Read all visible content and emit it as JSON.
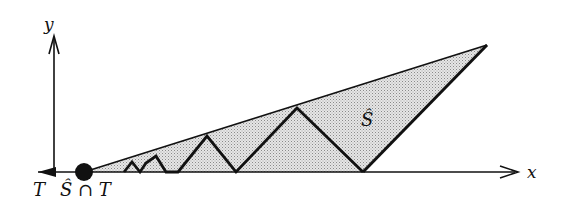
{
  "diagram": {
    "axes": {
      "x_label": "x",
      "y_label": "y"
    },
    "region_label": "Ŝ",
    "bottom_left_label_T": "T",
    "bottom_center_label": "Ŝ ∩ T",
    "colors": {
      "ink": "#111111",
      "fill": "#d4d4d4",
      "background": "#ffffff"
    },
    "geometry": {
      "origin": [
        84,
        172
      ],
      "apex": [
        487,
        45
      ],
      "right_base": [
        363,
        172
      ],
      "zigzag_peaks": [
        [
          132,
          160
        ],
        [
          156,
          157
        ],
        [
          207,
          136
        ],
        [
          297,
          108
        ]
      ],
      "zigzag_valleys": [
        [
          124,
          172
        ],
        [
          146,
          172
        ],
        [
          178,
          172
        ],
        [
          236,
          172
        ],
        [
          363,
          172
        ]
      ]
    }
  }
}
